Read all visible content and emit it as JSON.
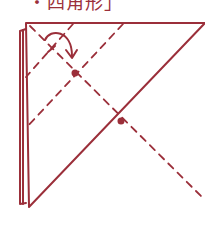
{
  "caption": {
    "text": "・四角形」"
  },
  "colors": {
    "ink": "#9b2f3a",
    "background": "#ffffff"
  },
  "diagram": {
    "type": "origami-fold-step",
    "shapes": {
      "triangle": [
        [
          26,
          23
        ],
        [
          205,
          23
        ],
        [
          29,
          207
        ]
      ],
      "back_layer_edge": [
        [
          20,
          30
        ],
        [
          20,
          205
        ]
      ],
      "dashed_lines": [
        [
          [
            30,
            25
          ],
          [
            205,
            200
          ]
        ],
        [
          [
            72,
            23
          ],
          [
            22,
            78
          ]
        ],
        [
          [
            122,
            23
          ],
          [
            22,
            128
          ]
        ]
      ],
      "dots": [
        [
          75,
          73
        ],
        [
          121,
          121
        ]
      ],
      "arrow": {
        "from": [
          45,
          38
        ],
        "to": [
          72,
          58
        ]
      }
    }
  }
}
